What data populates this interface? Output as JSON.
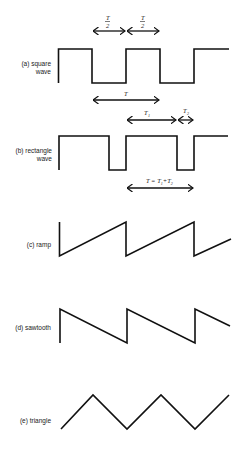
{
  "diagram": {
    "panels": [
      {
        "id": "a",
        "label_line1": "(a) square",
        "label_line2": "wave",
        "type": "square",
        "annotations": [
          {
            "text": "T/2",
            "from": "first fall",
            "to": "next rise"
          },
          {
            "text": "T/2",
            "from": "rise",
            "to": "next fall"
          },
          {
            "text": "T",
            "span": "one full period"
          }
        ]
      },
      {
        "id": "b",
        "label_line1": "(b) rectangle",
        "label_line2": "wave",
        "type": "rectangle",
        "annotations": [
          {
            "text": "T1",
            "span": "high time"
          },
          {
            "text": "T2",
            "span": "low time"
          },
          {
            "text": "T = T1 + T2",
            "span": "one full period"
          }
        ]
      },
      {
        "id": "c",
        "label_line1": "(c) ramp",
        "type": "ramp"
      },
      {
        "id": "d",
        "label_line1": "(d) sawtooth",
        "type": "sawtooth"
      },
      {
        "id": "e",
        "label_line1": "(e) triangle",
        "type": "triangle"
      }
    ],
    "math": {
      "half_T_num": "T",
      "half_T_den": "2",
      "T": "T",
      "T1": "T",
      "T1_sub": "1",
      "T2": "T",
      "T2_sub": "2",
      "period_eq": "T = T",
      "period_eq_sub1": "1",
      "period_eq_plus": "+T",
      "period_eq_sub2": "2"
    },
    "colors": {
      "stroke": "#111111",
      "background": "#ffffff"
    }
  }
}
